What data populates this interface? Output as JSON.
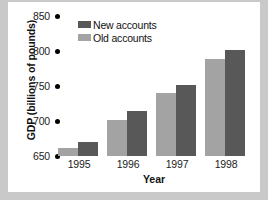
{
  "chart_data": {
    "type": "bar",
    "title": "",
    "xlabel": "Year",
    "ylabel": "GDP (billions of pounds)",
    "categories": [
      "1995",
      "1996",
      "1997",
      "1998"
    ],
    "ylim": [
      650,
      850
    ],
    "yticks": [
      650,
      700,
      750,
      800,
      850
    ],
    "ytick_labels": [
      "650",
      "700",
      "750",
      "800",
      "850"
    ],
    "grid": false,
    "legend_position": "top-left",
    "series": [
      {
        "name": "Old accounts",
        "color": "#a3a3a3",
        "values": [
          662,
          702,
          740,
          788
        ]
      },
      {
        "name": "New accounts",
        "color": "#585858",
        "values": [
          670,
          714,
          752,
          802
        ]
      }
    ],
    "legend_order": [
      "New accounts",
      "Old accounts"
    ],
    "bar_order_in_group": [
      "Old accounts",
      "New accounts"
    ]
  },
  "colors": {
    "page_background": "#c9c9c9",
    "figure_background": "#ffffff",
    "tick_dot": "#000000",
    "text": "#111111"
  }
}
